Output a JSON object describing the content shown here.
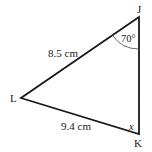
{
  "diagram": {
    "type": "triangle",
    "vertices": {
      "J": {
        "label": "J",
        "x": 139,
        "y": 17
      },
      "L": {
        "label": "L",
        "x": 21,
        "y": 98
      },
      "K": {
        "label": "K",
        "x": 139,
        "y": 134
      }
    },
    "sides": {
      "JL": {
        "label": "8.5 cm"
      },
      "LK": {
        "label": "9.4 cm"
      }
    },
    "angles": {
      "J": {
        "label": "70°"
      },
      "K": {
        "label": "x"
      }
    },
    "colors": {
      "line": "#1a1a1a",
      "arc": "#444444"
    }
  }
}
